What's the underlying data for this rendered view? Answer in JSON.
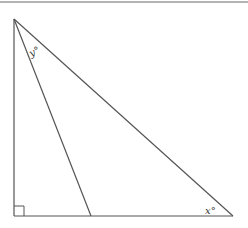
{
  "diagram": {
    "type": "right-triangle",
    "colors": {
      "stroke": "#555555",
      "top_rule": "#9a9a9a",
      "background": "#ffffff"
    },
    "vertices": {
      "top": [
        14,
        19
      ],
      "right_angle": [
        14,
        216
      ],
      "right": [
        233,
        216
      ],
      "cevian_foot": [
        91,
        216
      ]
    },
    "labels": {
      "y_angle": "y°",
      "x_angle": "x°"
    },
    "right_angle_marker": true
  }
}
